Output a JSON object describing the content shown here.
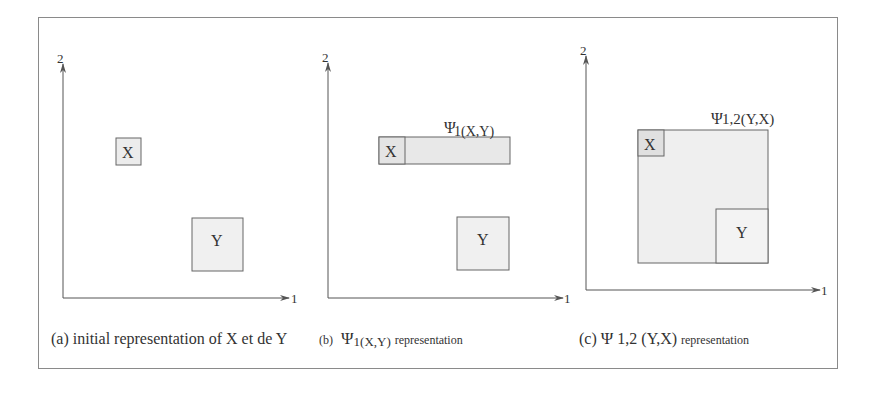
{
  "figure": {
    "panels": [
      {
        "id": "a",
        "axis_x_label": "1",
        "axis_y_label": "2",
        "box_x_label": "X",
        "box_y_label": "Y",
        "caption": {
          "prefix": "(a) initial representation of X et de Y"
        }
      },
      {
        "id": "b",
        "axis_x_label": "1",
        "axis_y_label": "2",
        "box_x_label": "X",
        "box_y_label": "Y",
        "region_psi": "Ψ",
        "region_sub": "1(X,Y)",
        "caption": {
          "prefix": "(b)",
          "psi": "Ψ",
          "sub": "1(X,Y)",
          "suffix": "representation"
        }
      },
      {
        "id": "c",
        "axis_x_label": "1",
        "axis_y_label": "2",
        "box_x_label": "X",
        "box_y_label": "Y",
        "region_psi": "Ψ",
        "region_sub": "1,2(Y,X)",
        "caption": {
          "prefix": "(c)",
          "psi": "Ψ",
          "mid": "1,2 (Y,X)",
          "suffix": "representation"
        }
      }
    ],
    "colors": {
      "box_fill_light": "#ececec",
      "box_fill_dark": "#dedede",
      "stroke": "#666666"
    }
  }
}
